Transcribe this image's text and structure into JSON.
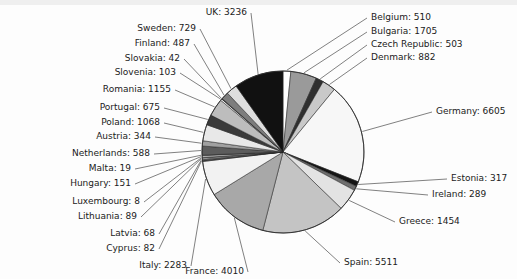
{
  "chart_data": {
    "type": "pie",
    "title": "",
    "subtitle": "",
    "xlabel": "",
    "ylabel": "",
    "legend_position": "none",
    "grid": false,
    "label_format": "{name}: {value}",
    "start_angle_deg": 90,
    "direction": "clockwise",
    "total": 38954,
    "categories": [
      "Belgium",
      "Bulgaria",
      "Czech Republic",
      "Denmark",
      "Germany",
      "Estonia",
      "Ireland",
      "Greece",
      "Spain",
      "France",
      "Italy",
      "Cyprus",
      "Latvia",
      "Lithuania",
      "Luxembourg",
      "Hungary",
      "Malta",
      "Netherlands",
      "Austria",
      "Poland",
      "Portugal",
      "Romania",
      "Slovenia",
      "Slovakia",
      "Finland",
      "Sweden",
      "UK"
    ],
    "values": [
      510,
      1705,
      503,
      882,
      6605,
      317,
      289,
      1454,
      5511,
      4010,
      2283,
      82,
      68,
      89,
      8,
      151,
      19,
      588,
      344,
      1068,
      675,
      1155,
      103,
      42,
      487,
      729,
      3236
    ],
    "labels": [
      "Belgium: 510",
      "Bulgaria: 1705",
      "Czech Republic: 503",
      "Denmark: 882",
      "Germany: 6605",
      "Estonia: 317",
      "Ireland: 289",
      "Greece: 1454",
      "Spain: 5511",
      "France: 4010",
      "Italy: 2283",
      "Cyprus: 82",
      "Latvia: 68",
      "Lithuania: 89",
      "Luxembourg: 8",
      "Hungary: 151",
      "Malta: 19",
      "Netherlands: 588",
      "Austria: 344",
      "Poland: 1068",
      "Portugal: 675",
      "Romania: 1155",
      "Slovenia: 103",
      "Slovakia: 42",
      "Finland: 487",
      "Sweden: 729",
      "UK: 3236"
    ],
    "slice_colors": [
      "#ffffff",
      "#9a9a9a",
      "#2f2f2f",
      "#c9c9c9",
      "#f7f7f7",
      "#151515",
      "#6f6f6f",
      "#e3e3e3",
      "#c4c4c4",
      "#a8a8a8",
      "#f2f2f2",
      "#4a4a4a",
      "#8d8d8d",
      "#d6d6d6",
      "#1f1f1f",
      "#b0b0b0",
      "#efefef",
      "#5c5c5c",
      "#a0a0a0",
      "#e8e8e8",
      "#3a3a3a",
      "#bdbdbd",
      "#f4f4f4",
      "#262626",
      "#7d7d7d",
      "#dedede",
      "#111111"
    ],
    "colors": {
      "background": "#fdfdfd",
      "outline": "#2b2b2b",
      "leader": "#4a4a4a",
      "text": "#1b1b1b"
    }
  },
  "labels_left": [
    {
      "text": "UK: 3236",
      "x": 247,
      "y": 15
    },
    {
      "text": "Sweden: 729",
      "x": 196,
      "y": 31
    },
    {
      "text": "Finland: 487",
      "x": 190,
      "y": 46
    },
    {
      "text": "Slovakia: 42",
      "x": 180,
      "y": 61
    },
    {
      "text": "Slovenia: 103",
      "x": 176,
      "y": 75
    },
    {
      "text": "Romania: 1155",
      "x": 171,
      "y": 92
    },
    {
      "text": "Portugal: 675",
      "x": 160,
      "y": 110
    },
    {
      "text": "Poland: 1068",
      "x": 160,
      "y": 125
    },
    {
      "text": "Austria: 344",
      "x": 151,
      "y": 139
    },
    {
      "text": "Netherlands: 588",
      "x": 150,
      "y": 156
    },
    {
      "text": "Malta: 19",
      "x": 131,
      "y": 171
    },
    {
      "text": "Hungary: 151",
      "x": 131,
      "y": 186
    },
    {
      "text": "Luxembourg: 8",
      "x": 140,
      "y": 204
    },
    {
      "text": "Lithuania: 89",
      "x": 137,
      "y": 219
    },
    {
      "text": "Latvia: 68",
      "x": 155,
      "y": 236
    },
    {
      "text": "Cyprus: 82",
      "x": 155,
      "y": 251
    },
    {
      "text": "Italy: 2283",
      "x": 187,
      "y": 268
    },
    {
      "text": "France: 4010",
      "x": 244,
      "y": 274
    }
  ],
  "labels_right": [
    {
      "text": "Belgium: 510",
      "x": 371,
      "y": 20
    },
    {
      "text": "Bulgaria: 1705",
      "x": 371,
      "y": 34
    },
    {
      "text": "Czech Republic: 503",
      "x": 371,
      "y": 47
    },
    {
      "text": "Denmark: 882",
      "x": 371,
      "y": 60
    },
    {
      "text": "Germany: 6605",
      "x": 436,
      "y": 114
    },
    {
      "text": "Estonia: 317",
      "x": 451,
      "y": 181
    },
    {
      "text": "Ireland: 289",
      "x": 432,
      "y": 197
    },
    {
      "text": "Greece: 1454",
      "x": 399,
      "y": 224
    },
    {
      "text": "Spain: 5511",
      "x": 344,
      "y": 265
    }
  ]
}
